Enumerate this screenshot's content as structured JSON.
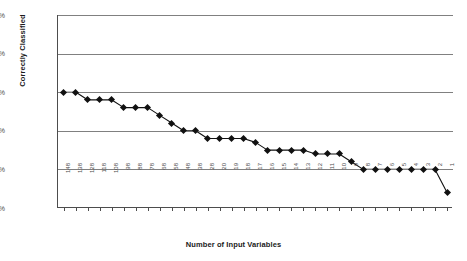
{
  "chart_data": {
    "type": "line",
    "title": "",
    "xlabel": "Number of Input Variables",
    "ylabel": "Correctly Classified",
    "categories": [
      "148",
      "138",
      "128",
      "118",
      "108",
      "98",
      "88",
      "78",
      "68",
      "58",
      "48",
      "38",
      "28",
      "20",
      "19",
      "18",
      "17",
      "16",
      "15",
      "14",
      "13",
      "12",
      "11",
      "10",
      "9",
      "8",
      "7",
      "6",
      "5",
      "4",
      "3",
      "2",
      "1"
    ],
    "values": [
      90.0,
      90.0,
      89.0,
      89.0,
      89.0,
      88.0,
      88.0,
      88.0,
      87.0,
      86.0,
      85.0,
      85.0,
      84.0,
      84.0,
      84.0,
      84.0,
      83.5,
      82.5,
      82.5,
      82.5,
      82.5,
      82.0,
      82.0,
      82.0,
      81.0,
      80.0,
      80.0,
      80.0,
      80.0,
      80.0,
      80.0,
      80.0,
      77.0
    ],
    "ylim": [
      75,
      100
    ],
    "ytick_labels": [
      "100%",
      "95%",
      "90%",
      "85%",
      "80%",
      "75%"
    ],
    "ytick_values": [
      100,
      95,
      90,
      85,
      80,
      75
    ],
    "grid": true,
    "legend": "none",
    "series_color": "#111111",
    "grid_color": "#808080",
    "axis_color": "#4d4d4d"
  }
}
